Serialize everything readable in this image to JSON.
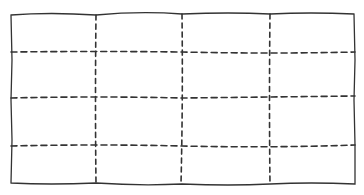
{
  "diagram": {
    "type": "hand-drawn grid",
    "rows": 4,
    "columns": 4,
    "outer_border_style": "solid",
    "inner_lines_style": "dashed",
    "stroke_color": "#333333",
    "background": "#ffffff"
  }
}
